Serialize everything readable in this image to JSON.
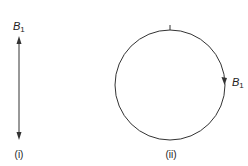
{
  "figure": {
    "panel_i": {
      "label_var": "B",
      "label_sub": "1",
      "caption": "(i)",
      "arrow": {
        "x": 19,
        "y_top": 37,
        "y_bottom": 139,
        "double_headed": true
      }
    },
    "panel_ii": {
      "label_var": "B",
      "label_sub": "1",
      "caption": "(ii)",
      "circle": {
        "cx": 170,
        "cy": 85,
        "r": 55,
        "direction": "clockwise"
      }
    },
    "stroke_color": "#333333"
  }
}
